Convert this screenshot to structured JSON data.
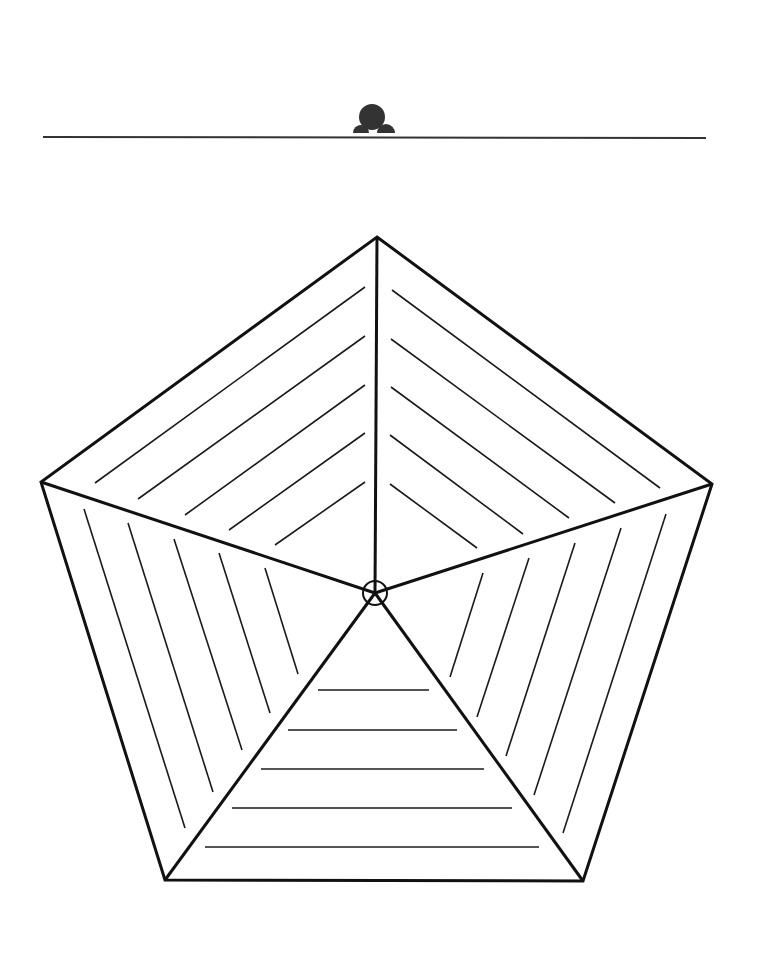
{
  "page": {
    "width": 768,
    "height": 972,
    "background": "#ffffff"
  },
  "header": {
    "emblem": {
      "icon": "mound-emblem-icon",
      "color": "#333333",
      "dome": {
        "cx": 372,
        "cy": 117,
        "rx": 13,
        "ry": 13
      },
      "lobes": [
        {
          "cx": 361,
          "cy": 133,
          "r": 8
        },
        {
          "cx": 386,
          "cy": 133,
          "r": 9
        }
      ]
    },
    "rule": {
      "x1": 43,
      "y1": 137,
      "x2": 706,
      "y2": 138,
      "color": "#333333"
    }
  },
  "diagram": {
    "type": "hatched-pentagon",
    "stroke_color": "#111111",
    "center": {
      "x": 375,
      "y": 593,
      "ring_radius": 12
    },
    "vertices": [
      {
        "name": "top",
        "x": 377,
        "y": 237
      },
      {
        "name": "right",
        "x": 712,
        "y": 484
      },
      {
        "name": "bottom-right",
        "x": 583,
        "y": 881
      },
      {
        "name": "bottom-left",
        "x": 165,
        "y": 880
      },
      {
        "name": "left",
        "x": 41,
        "y": 482
      }
    ],
    "sectors": [
      {
        "name": "upper-left",
        "hatch_count": 5,
        "hatches": [
          [
            365,
            287,
            95,
            483
          ],
          [
            365,
            336,
            138,
            499
          ],
          [
            365,
            385,
            185,
            515
          ],
          [
            365,
            433,
            229,
            530
          ],
          [
            365,
            482,
            275,
            545
          ]
        ]
      },
      {
        "name": "upper-right",
        "hatch_count": 5,
        "hatches": [
          [
            392,
            290,
            660,
            488
          ],
          [
            391,
            339,
            615,
            503
          ],
          [
            391,
            387,
            569,
            518
          ],
          [
            390,
            435,
            523,
            534
          ],
          [
            390,
            484,
            477,
            548
          ]
        ]
      },
      {
        "name": "lower-right",
        "hatch_count": 5,
        "hatches": [
          [
            666,
            514,
            563,
            833
          ],
          [
            621,
            528,
            534,
            795
          ],
          [
            575,
            543,
            506,
            756
          ],
          [
            529,
            558,
            477,
            717
          ],
          [
            483,
            573,
            450,
            677
          ]
        ]
      },
      {
        "name": "bottom",
        "hatch_count": 5,
        "hatches": [
          [
            318,
            690,
            429,
            690
          ],
          [
            288,
            730,
            457,
            730
          ],
          [
            261,
            769,
            484,
            769
          ],
          [
            232,
            808,
            512,
            808
          ],
          [
            205,
            847,
            539,
            847
          ]
        ]
      },
      {
        "name": "lower-left",
        "hatch_count": 5,
        "hatches": [
          [
            84,
            509,
            185,
            828
          ],
          [
            128,
            523,
            213,
            792
          ],
          [
            174,
            539,
            242,
            750
          ],
          [
            219,
            553,
            270,
            713
          ],
          [
            265,
            568,
            298,
            674
          ]
        ]
      }
    ]
  }
}
